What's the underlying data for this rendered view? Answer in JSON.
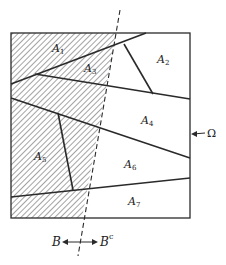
{
  "diagram": {
    "colors": {
      "line": "#2a2a2a",
      "hatch": "#555555",
      "background": "#ffffff"
    },
    "regions": [
      {
        "id": "A1",
        "label": "A",
        "sub": "1",
        "x": 52,
        "y": 52
      },
      {
        "id": "A2",
        "label": "A",
        "sub": "2",
        "x": 157,
        "y": 63
      },
      {
        "id": "A3",
        "label": "A",
        "sub": "3",
        "x": 84,
        "y": 72
      },
      {
        "id": "A4",
        "label": "A",
        "sub": "4",
        "x": 141,
        "y": 124
      },
      {
        "id": "A5",
        "label": "A",
        "sub": "5",
        "x": 34,
        "y": 160
      },
      {
        "id": "A6",
        "label": "A",
        "sub": "6",
        "x": 124,
        "y": 168
      },
      {
        "id": "A7",
        "label": "A",
        "sub": "7",
        "x": 128,
        "y": 205
      }
    ],
    "omega": {
      "label": "Ω"
    },
    "set_labels": {
      "B": "B",
      "Bc_base": "B",
      "Bc_sup": "c"
    }
  }
}
